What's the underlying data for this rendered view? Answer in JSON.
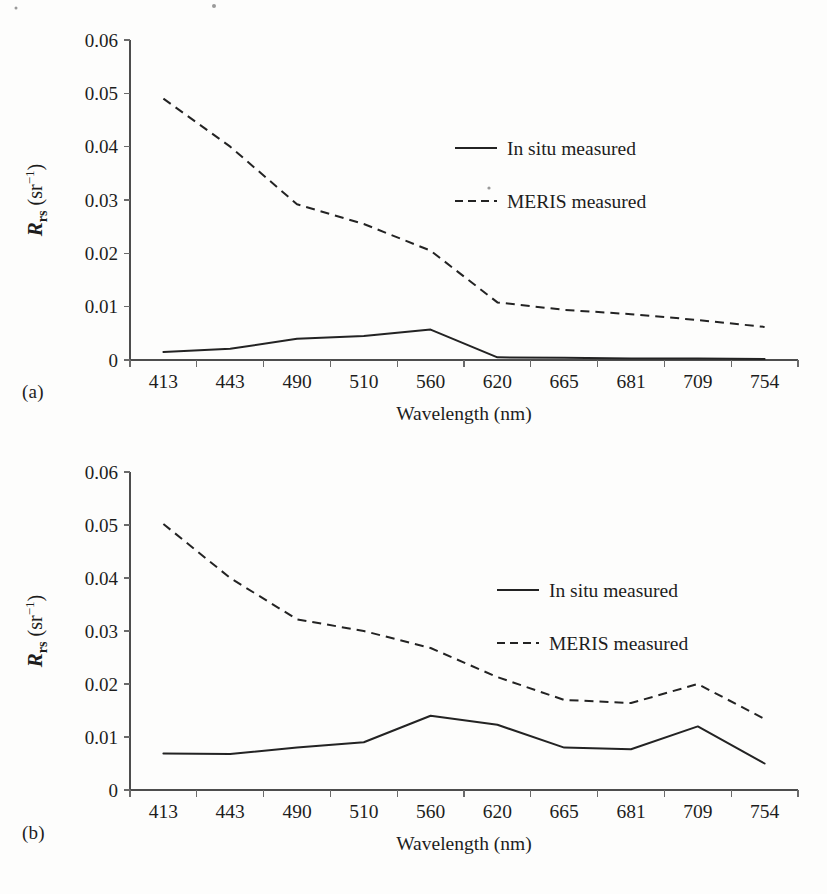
{
  "figure": {
    "panels": [
      {
        "tag": "(a)",
        "xlabel": "Wavelength (nm)",
        "ylabel_main": "R",
        "ylabel_sub": "rs",
        "ylabel_unit": "(sr",
        "ylabel_exp": "−1",
        "ylabel_close": ")",
        "legend": [
          {
            "label": "In situ measured",
            "style": "solid"
          },
          {
            "label": "MERIS measured",
            "style": "dashed"
          }
        ]
      },
      {
        "tag": "(b)",
        "xlabel": "Wavelength (nm)",
        "ylabel_main": "R",
        "ylabel_sub": "rs",
        "ylabel_unit": "(sr",
        "ylabel_exp": "−1",
        "ylabel_close": ")",
        "legend": [
          {
            "label": "In situ measured",
            "style": "solid"
          },
          {
            "label": "MERIS measured",
            "style": "dashed"
          }
        ]
      }
    ]
  },
  "chart_data": [
    {
      "type": "line",
      "panel": "(a)",
      "title": "",
      "xlabel": "Wavelength (nm)",
      "ylabel": "R_rs (sr^-1)",
      "categories": [
        "413",
        "443",
        "490",
        "510",
        "560",
        "620",
        "665",
        "681",
        "709",
        "754"
      ],
      "ytick_labels": [
        "0.06",
        "0.05",
        "0.04",
        "0.03",
        "0.02",
        "0.01",
        "0"
      ],
      "ytick_values": [
        0.06,
        0.05,
        0.04,
        0.03,
        0.02,
        0.01,
        0
      ],
      "ylim": [
        0,
        0.06
      ],
      "grid": false,
      "legend_position": "upper-right-inside",
      "series": [
        {
          "name": "In situ measured",
          "style": "solid",
          "values": [
            0.0015,
            0.0021,
            0.004,
            0.0045,
            0.0057,
            0.0005,
            0.0004,
            0.0003,
            0.0003,
            0.0002
          ]
        },
        {
          "name": "MERIS measured",
          "style": "dashed",
          "values": [
            0.049,
            0.04,
            0.0292,
            0.0255,
            0.0205,
            0.0108,
            0.0094,
            0.0086,
            0.0075,
            0.0062
          ]
        }
      ]
    },
    {
      "type": "line",
      "panel": "(b)",
      "title": "",
      "xlabel": "Wavelength (nm)",
      "ylabel": "R_rs (sr^-1)",
      "categories": [
        "413",
        "443",
        "490",
        "510",
        "560",
        "620",
        "665",
        "681",
        "709",
        "754"
      ],
      "ytick_labels": [
        "0.06",
        "0.05",
        "0.04",
        "0.03",
        "0.02",
        "0.01",
        "0"
      ],
      "ytick_values": [
        0.06,
        0.05,
        0.04,
        0.03,
        0.02,
        0.01,
        0
      ],
      "ylim": [
        0,
        0.06
      ],
      "grid": false,
      "legend_position": "upper-right-inside",
      "series": [
        {
          "name": "In situ measured",
          "style": "solid",
          "values": [
            0.0069,
            0.0068,
            0.008,
            0.009,
            0.014,
            0.0123,
            0.008,
            0.0077,
            0.012,
            0.005
          ]
        },
        {
          "name": "MERIS measured",
          "style": "dashed",
          "values": [
            0.0502,
            0.04,
            0.0322,
            0.03,
            0.0268,
            0.0213,
            0.017,
            0.0164,
            0.02,
            0.0134
          ]
        }
      ]
    }
  ]
}
